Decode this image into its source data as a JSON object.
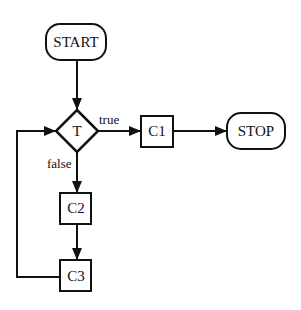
{
  "diagram": {
    "type": "flowchart",
    "colors": {
      "stroke": "#111111",
      "background": "#ffffff"
    },
    "nodes": {
      "start": {
        "label": "START",
        "shape": "rounded-rect"
      },
      "test": {
        "label": "T",
        "shape": "diamond"
      },
      "c1": {
        "label": "C1",
        "shape": "rect"
      },
      "stop": {
        "label": "STOP",
        "shape": "rounded-rect"
      },
      "c2": {
        "label": "C2",
        "shape": "rect"
      },
      "c3": {
        "label": "C3",
        "shape": "rect"
      }
    },
    "edges": {
      "start_to_test": {
        "from": "START",
        "to": "T",
        "label": ""
      },
      "test_true": {
        "from": "T",
        "to": "C1",
        "label": "true"
      },
      "c1_to_stop": {
        "from": "C1",
        "to": "STOP",
        "label": ""
      },
      "test_false": {
        "from": "T",
        "to": "C2",
        "label": "false"
      },
      "c2_to_c3": {
        "from": "C2",
        "to": "C3",
        "label": ""
      },
      "c3_loop": {
        "from": "C3",
        "to": "T",
        "label": ""
      }
    }
  }
}
